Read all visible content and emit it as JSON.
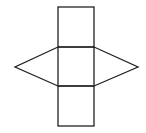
{
  "diagram": {
    "stroke_color": "#222222",
    "background": "#ffffff",
    "shapes": {
      "top_rectangle": {
        "x": 58,
        "y": 7,
        "width": 36,
        "height": 40
      },
      "middle_rectangle": {
        "x": 58,
        "y": 47,
        "width": 36,
        "height": 39
      },
      "bottom_rectangle": {
        "x": 58,
        "y": 86,
        "width": 36,
        "height": 40
      },
      "left_triangle": {
        "points": "58,47 15,67 58,86"
      },
      "right_triangle": {
        "points": "94,47 138,67 94,86"
      }
    }
  }
}
